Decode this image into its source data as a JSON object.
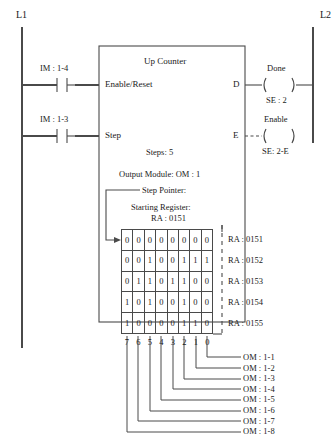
{
  "diagram": {
    "rails": {
      "left_label": "L1",
      "right_label": "L2"
    },
    "contacts": [
      {
        "label": "IM : 1-4",
        "target": "Enable/Reset"
      },
      {
        "label": "IM : 1-3",
        "target": "Step"
      }
    ],
    "block": {
      "title": "Up Counter",
      "input_enable_reset": "Enable/Reset",
      "input_step": "Step",
      "output_d": "D",
      "output_e": "E",
      "params": [
        "Steps: 5",
        "Output Module: OM : 1",
        "Step Pointer:",
        "Starting Register:",
        "RA : 0151"
      ],
      "steps_line": "Steps: 5",
      "output_module_line": "Output Module: OM : 1",
      "step_pointer_line": "Step Pointer:",
      "starting_register_line": "Starting Register:",
      "starting_register_value": "RA : 0151"
    },
    "coils": [
      {
        "name": "Done",
        "address": "SE : 2",
        "style": "solid"
      },
      {
        "name": "Enable",
        "address": "SE: 2-E",
        "style": "dashed"
      }
    ],
    "matrix": {
      "registers": [
        "RA : 0151",
        "RA : 0152",
        "RA : 0153",
        "RA : 0154",
        "RA : 0155"
      ],
      "bit_positions": [
        "7",
        "6",
        "5",
        "4",
        "3",
        "2",
        "1",
        "0"
      ],
      "rows": [
        [
          "0",
          "0",
          "0",
          "0",
          "0",
          "0",
          "0",
          "0"
        ],
        [
          "0",
          "0",
          "1",
          "0",
          "0",
          "1",
          "1",
          "1"
        ],
        [
          "0",
          "1",
          "1",
          "0",
          "1",
          "1",
          "0",
          "0"
        ],
        [
          "1",
          "0",
          "1",
          "0",
          "0",
          "1",
          "0",
          "0"
        ],
        [
          "1",
          "0",
          "0",
          "0",
          "0",
          "1",
          "1",
          "0"
        ]
      ]
    },
    "outputs": [
      "OM : 1-1",
      "OM : 1-2",
      "OM : 1-3",
      "OM : 1-4",
      "OM : 1-5",
      "OM : 1-6",
      "OM : 1-7",
      "OM : 1-8"
    ],
    "colors": {
      "line": "#4a4a4a",
      "text": "#1a1a1a",
      "background": "#ffffff"
    }
  }
}
